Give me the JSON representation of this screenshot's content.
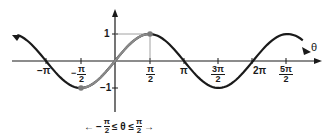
{
  "chart_data": {
    "type": "line",
    "title": "",
    "function": "y = sin(theta)",
    "xlabel": "θ",
    "ylabel": "",
    "x_tick_labels": [
      "−π",
      "−π/2",
      "π/2",
      "π",
      "3π/2",
      "2π",
      "5π/2"
    ],
    "x_tick_values": [
      -3.1416,
      -1.5708,
      1.5708,
      3.1416,
      4.7124,
      6.2832,
      7.854
    ],
    "y_tick_labels": [
      "1",
      "−1"
    ],
    "y_tick_values": [
      1,
      -1
    ],
    "xlim": [
      -4.5,
      9.0
    ],
    "ylim": [
      -1.9,
      1.7
    ],
    "grid": false,
    "series": [
      {
        "name": "sin θ (full curve)",
        "color": "#1a1a1a",
        "x": [
          -4.4,
          -3.1416,
          -1.5708,
          0,
          1.5708,
          3.1416,
          4.7124,
          6.2832,
          7.854,
          8.6
        ],
        "values": [
          0.95,
          0,
          -1,
          0,
          1,
          0,
          -1,
          0,
          1,
          0.73
        ]
      },
      {
        "name": "restricted domain −π/2 ≤ θ ≤ π/2",
        "color": "#8a8a8a",
        "x": [
          -1.5708,
          -0.7854,
          0,
          0.7854,
          1.5708
        ],
        "values": [
          -1,
          -0.7071,
          0,
          0.7071,
          1
        ]
      }
    ],
    "points": [
      {
        "x": -1.5708,
        "y": -1,
        "label": "(−π/2, −1)"
      },
      {
        "x": 1.5708,
        "y": 1,
        "label": "(π/2, 1)"
      }
    ],
    "annotations": [
      "−π/2 ≤ θ ≤ π/2"
    ],
    "legend": null
  },
  "labels": {
    "axis_theta": "θ",
    "y_one": "1",
    "y_neg_one": "−1",
    "neg_pi": "−π",
    "pi": "π",
    "two_pi": "2π",
    "pi_sym": "π",
    "two": "2",
    "three_pi": "3π",
    "five_pi": "5π",
    "minus": "−",
    "domain_minus": "−",
    "domain_mid": "≤ θ ≤",
    "arrow_left": "←",
    "arrow_right": "→"
  }
}
